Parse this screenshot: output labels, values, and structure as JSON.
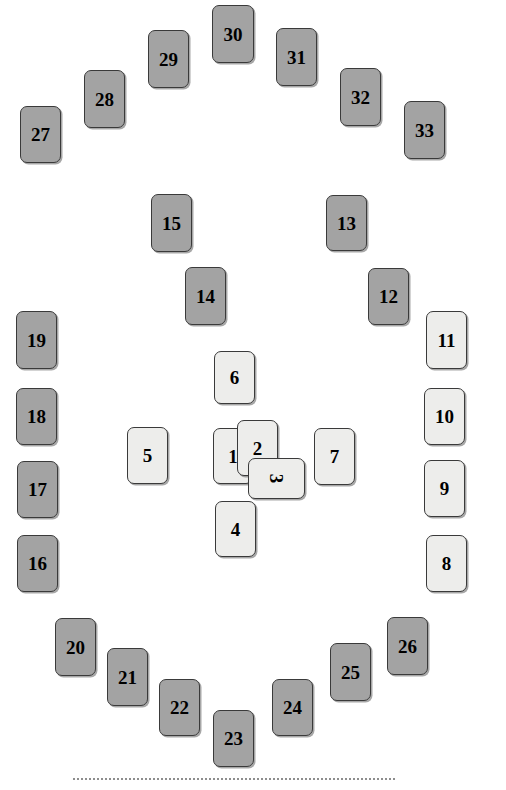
{
  "figure": {
    "kind": "card-layout-diagram",
    "background_color": "#ffffff",
    "card_fill_dark": "#a3a3a3",
    "card_fill_light": "#ededeb",
    "card_border_color": "#3a3a3a",
    "label_color": "#000000"
  },
  "baseline": {
    "name": "dotted-baseline",
    "color": "#8d8d8d",
    "style": "dotted",
    "x": 73,
    "y": 778,
    "width": 322
  },
  "cards": [
    {
      "label": "1",
      "shade": "light",
      "x": 213,
      "y": 428,
      "w": 40,
      "h": 56,
      "rotated": false
    },
    {
      "label": "2",
      "shade": "light",
      "x": 237,
      "y": 420,
      "w": 41,
      "h": 56,
      "rotated": false
    },
    {
      "label": "3",
      "shade": "light",
      "x": 248,
      "y": 458,
      "w": 57,
      "h": 41,
      "rotated": true
    },
    {
      "label": "4",
      "shade": "light",
      "x": 215,
      "y": 501,
      "w": 41,
      "h": 56,
      "rotated": false
    },
    {
      "label": "5",
      "shade": "light",
      "x": 127,
      "y": 427,
      "w": 41,
      "h": 57,
      "rotated": false
    },
    {
      "label": "6",
      "shade": "light",
      "x": 214,
      "y": 351,
      "w": 41,
      "h": 53,
      "rotated": false
    },
    {
      "label": "7",
      "shade": "light",
      "x": 314,
      "y": 428,
      "w": 41,
      "h": 57,
      "rotated": false
    },
    {
      "label": "8",
      "shade": "light",
      "x": 426,
      "y": 535,
      "w": 41,
      "h": 57,
      "rotated": false
    },
    {
      "label": "9",
      "shade": "light",
      "x": 424,
      "y": 460,
      "w": 41,
      "h": 57,
      "rotated": false
    },
    {
      "label": "10",
      "shade": "light",
      "x": 424,
      "y": 388,
      "w": 41,
      "h": 57,
      "rotated": false
    },
    {
      "label": "11",
      "shade": "light",
      "x": 426,
      "y": 311,
      "w": 41,
      "h": 58,
      "rotated": false
    },
    {
      "label": "12",
      "shade": "dark",
      "x": 368,
      "y": 268,
      "w": 41,
      "h": 57,
      "rotated": false
    },
    {
      "label": "13",
      "shade": "dark",
      "x": 326,
      "y": 195,
      "w": 41,
      "h": 56,
      "rotated": false
    },
    {
      "label": "14",
      "shade": "dark",
      "x": 185,
      "y": 267,
      "w": 41,
      "h": 58,
      "rotated": false
    },
    {
      "label": "15",
      "shade": "dark",
      "x": 151,
      "y": 194,
      "w": 41,
      "h": 58,
      "rotated": false
    },
    {
      "label": "16",
      "shade": "dark",
      "x": 17,
      "y": 535,
      "w": 41,
      "h": 57,
      "rotated": false
    },
    {
      "label": "17",
      "shade": "dark",
      "x": 17,
      "y": 461,
      "w": 41,
      "h": 57,
      "rotated": false
    },
    {
      "label": "18",
      "shade": "dark",
      "x": 16,
      "y": 388,
      "w": 41,
      "h": 57,
      "rotated": false
    },
    {
      "label": "19",
      "shade": "dark",
      "x": 16,
      "y": 311,
      "w": 41,
      "h": 58,
      "rotated": false
    },
    {
      "label": "20",
      "shade": "dark",
      "x": 55,
      "y": 618,
      "w": 41,
      "h": 58,
      "rotated": false
    },
    {
      "label": "21",
      "shade": "dark",
      "x": 107,
      "y": 648,
      "w": 41,
      "h": 58,
      "rotated": false
    },
    {
      "label": "22",
      "shade": "dark",
      "x": 159,
      "y": 679,
      "w": 41,
      "h": 57,
      "rotated": false
    },
    {
      "label": "23",
      "shade": "dark",
      "x": 213,
      "y": 710,
      "w": 41,
      "h": 57,
      "rotated": false
    },
    {
      "label": "24",
      "shade": "dark",
      "x": 272,
      "y": 679,
      "w": 41,
      "h": 57,
      "rotated": false
    },
    {
      "label": "25",
      "shade": "dark",
      "x": 330,
      "y": 643,
      "w": 41,
      "h": 58,
      "rotated": false
    },
    {
      "label": "26",
      "shade": "dark",
      "x": 387,
      "y": 617,
      "w": 41,
      "h": 58,
      "rotated": false
    },
    {
      "label": "27",
      "shade": "dark",
      "x": 20,
      "y": 106,
      "w": 41,
      "h": 57,
      "rotated": false
    },
    {
      "label": "28",
      "shade": "dark",
      "x": 84,
      "y": 70,
      "w": 41,
      "h": 58,
      "rotated": false
    },
    {
      "label": "29",
      "shade": "dark",
      "x": 148,
      "y": 30,
      "w": 41,
      "h": 58,
      "rotated": false
    },
    {
      "label": "30",
      "shade": "dark",
      "x": 212,
      "y": 5,
      "w": 42,
      "h": 58,
      "rotated": false
    },
    {
      "label": "31",
      "shade": "dark",
      "x": 276,
      "y": 28,
      "w": 41,
      "h": 58,
      "rotated": false
    },
    {
      "label": "32",
      "shade": "dark",
      "x": 340,
      "y": 68,
      "w": 41,
      "h": 58,
      "rotated": false
    },
    {
      "label": "33",
      "shade": "dark",
      "x": 404,
      "y": 101,
      "w": 41,
      "h": 58,
      "rotated": false
    }
  ]
}
